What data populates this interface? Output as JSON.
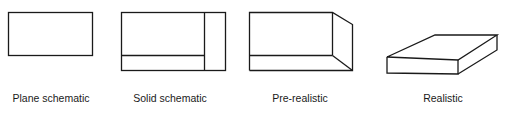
{
  "diagram": {
    "stroke_color": "#1a1a1a",
    "background": "#ffffff",
    "items": [
      {
        "label": "Plane schematic",
        "shape": "flat-rectangle"
      },
      {
        "label": "Solid schematic",
        "shape": "rectangle-with-side-and-bottom-face"
      },
      {
        "label": "Pre-realistic",
        "shape": "box-with-perspective-side"
      },
      {
        "label": "Realistic",
        "shape": "isometric-slab"
      }
    ]
  }
}
